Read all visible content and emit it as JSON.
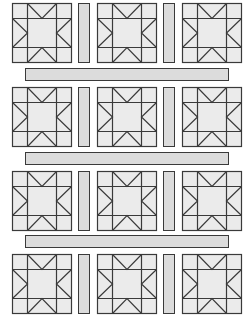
{
  "diagram": {
    "type": "quilt-layout",
    "block_name": "sawtooth-star",
    "rows": 4,
    "columns": 3,
    "block_size": 59,
    "block_grid": [
      15,
      29,
      15
    ],
    "colors": {
      "fill": "#ebebeb",
      "sash_fill": "#dcdcdc",
      "line": "#3a3a3a",
      "background": "#ffffff"
    },
    "block_columns_x": [
      12,
      97,
      182
    ],
    "block_rows_y": [
      3,
      87,
      171,
      254
    ],
    "vertical_sashes_x": [
      78,
      163
    ],
    "vertical_sash_width": 11,
    "horizontal_sashes": [
      {
        "x": 25,
        "y": 68,
        "width": 203,
        "height": 12
      },
      {
        "x": 25,
        "y": 152,
        "width": 203,
        "height": 12
      },
      {
        "x": 25,
        "y": 235,
        "width": 203,
        "height": 12
      }
    ]
  }
}
